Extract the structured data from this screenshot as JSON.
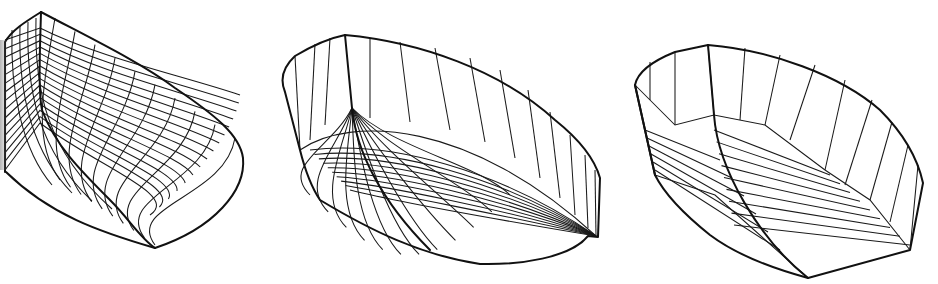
{
  "figure": {
    "background": "#ffffff",
    "line_color": "#111111",
    "panels": [
      {
        "id": "hull-1",
        "style": "round-bilge hull with dense curved wireframe grid (waterlines and stations)"
      },
      {
        "id": "hull-2",
        "style": "hull with vertical topside panels and curved bottom grid radiating from stem"
      },
      {
        "id": "hull-3",
        "style": "hard-chine hull with flat planar facets (multi-chine)"
      }
    ]
  }
}
